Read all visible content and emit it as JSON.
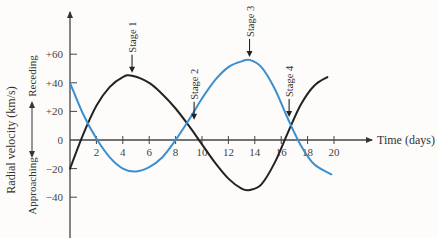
{
  "chart_data": {
    "type": "line",
    "title": "",
    "xlabel": "Time (days)",
    "ylabel": "Radial velocity (km/s)",
    "ylabel_direction": {
      "positive": "Receding",
      "negative": "Approaching"
    },
    "xlim": [
      0,
      20
    ],
    "ylim": [
      -60,
      80
    ],
    "x_ticks": [
      2,
      4,
      6,
      8,
      10,
      12,
      14,
      16,
      18,
      20
    ],
    "x_tick_labels": [
      "2",
      "4",
      "6",
      "8",
      "10",
      "12",
      "14",
      "16",
      "18",
      "20"
    ],
    "y_ticks": [
      60,
      40,
      20,
      0,
      -20,
      -40
    ],
    "y_tick_labels": [
      "+60",
      "+40",
      "+20",
      "0",
      "−20",
      "−40"
    ],
    "grid": false,
    "legend": null,
    "series": [
      {
        "name": "Star A (black)",
        "color": "#222222",
        "x": [
          0,
          1,
          2,
          3,
          4,
          4.7,
          6,
          7,
          8,
          9,
          10,
          11,
          12,
          13,
          13.6,
          14.5,
          15.5,
          16.5,
          17.5,
          18.5,
          19.5
        ],
        "y": [
          -20,
          4,
          24,
          37,
          44,
          45,
          40,
          32,
          22,
          10,
          -3,
          -16,
          -27,
          -34,
          -35,
          -31,
          -16,
          5,
          25,
          38,
          44
        ]
      },
      {
        "name": "Star B (blue)",
        "color": "#3a8fd0",
        "x": [
          0,
          1,
          2,
          3,
          4,
          5,
          6,
          7,
          8,
          9,
          10,
          11,
          12,
          13,
          13.6,
          14.5,
          15.5,
          16.5,
          17.5,
          18.5,
          19.8
        ],
        "y": [
          40,
          18,
          1,
          -12,
          -20,
          -22,
          -19,
          -12,
          0,
          14,
          29,
          42,
          51,
          55,
          56,
          51,
          36,
          15,
          -4,
          -17,
          -24
        ]
      }
    ],
    "annotations": [
      {
        "label": "Stage 1",
        "x": 4.7,
        "y": 45
      },
      {
        "label": "Stage 2",
        "x": 9.4,
        "y": 12
      },
      {
        "label": "Stage 3",
        "x": 13.6,
        "y": 56
      },
      {
        "label": "Stage 4",
        "x": 16.6,
        "y": 14
      }
    ]
  }
}
